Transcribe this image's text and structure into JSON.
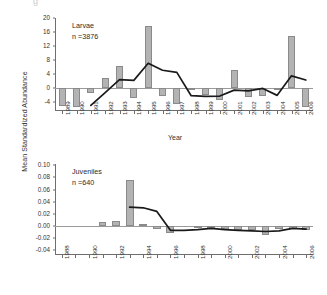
{
  "figure": {
    "shared_ylabel": "Mean Standardized Abundance",
    "stray_mark": "g"
  },
  "panels": [
    {
      "id": "larvae",
      "annotation_title": "Larvae",
      "annotation_n": "n =3876",
      "xlabel": "Year"
    },
    {
      "id": "juveniles",
      "annotation_title": "Juveniles",
      "annotation_n": "n =640",
      "xlabel": ""
    }
  ],
  "chart_data": [
    {
      "type": "bar",
      "id": "larvae",
      "title": "Larvae",
      "annotation": "n =3876",
      "xlabel": "Year",
      "ylabel": "Mean Standardized Abundance",
      "categories": [
        1989,
        1990,
        1991,
        1992,
        1993,
        1994,
        1995,
        1996,
        1997,
        1998,
        1999,
        2000,
        2001,
        2002,
        2003,
        2004,
        2005,
        2006
      ],
      "tick_labels": [
        "1989",
        "1990",
        "1991",
        "1992",
        "1993",
        "1994",
        "1995",
        "1996",
        "1997",
        "1998",
        "1999",
        "2000",
        "2001",
        "2002",
        "2003",
        "2004",
        "2005",
        "2006"
      ],
      "values": [
        -5.2,
        -5.4,
        -1.6,
        2.8,
        6.2,
        -3.0,
        17.6,
        -2.4,
        -4.6,
        -0.2,
        -2.2,
        -3.4,
        5.0,
        -2.6,
        -2.4,
        -0.3,
        14.8,
        -5.6
      ],
      "series": [
        {
          "name": "5-year moving average",
          "type": "line",
          "x": [
            1991,
            1992,
            1993,
            1994,
            1995,
            1996,
            1997,
            1998,
            1999,
            2000,
            2001,
            2002,
            2003,
            2004,
            2005,
            2006
          ],
          "values": [
            -5.1,
            -1.4,
            2.3,
            2.1,
            7.0,
            5.0,
            4.4,
            -2.3,
            -2.5,
            -2.4,
            -0.7,
            -0.9,
            -0.2,
            -2.2,
            3.4,
            2.2
          ]
        }
      ],
      "ylim": [
        -6.4,
        20
      ],
      "yticks": [
        -4,
        0,
        4,
        8,
        12,
        16,
        20
      ],
      "ytick_labels": [
        "-4",
        "0",
        "4",
        "8",
        "12",
        "16",
        "20"
      ],
      "grid": false,
      "legend": "none"
    },
    {
      "type": "bar",
      "id": "juveniles",
      "title": "Juveniles",
      "annotation": "n =640",
      "xlabel": "",
      "ylabel": "Mean Standardized Abundance",
      "categories": [
        1988,
        1989,
        1990,
        1991,
        1992,
        1993,
        1994,
        1995,
        1996,
        1997,
        1998,
        1999,
        2000,
        2001,
        2002,
        2003,
        2004,
        2005,
        2006
      ],
      "tick_labels": [
        "1988",
        "",
        "1990",
        "",
        "1992",
        "",
        "1994",
        "",
        "1996",
        "",
        "1998",
        "",
        "2000",
        "",
        "2002",
        "",
        "2004",
        "",
        "2006"
      ],
      "values": [
        0,
        0,
        0,
        0.007,
        0.009,
        0.075,
        0.003,
        -0.005,
        -0.011,
        0.0,
        -0.002,
        -0.004,
        -0.005,
        -0.006,
        -0.006,
        -0.015,
        -0.005,
        -0.005,
        -0.006
      ],
      "series": [
        {
          "name": "5-year moving average",
          "type": "line",
          "x": [
            1993,
            1994,
            1995,
            1996,
            1997,
            1998,
            1999,
            2000,
            2001,
            2002,
            2003,
            2004,
            2005,
            2006
          ],
          "values": [
            0.031,
            0.03,
            0.024,
            -0.007,
            -0.007,
            -0.006,
            -0.004,
            -0.006,
            -0.007,
            -0.008,
            -0.009,
            -0.008,
            -0.004,
            -0.005
          ]
        }
      ],
      "ylim": [
        -0.046,
        0.102
      ],
      "yticks": [
        -0.04,
        -0.02,
        0.0,
        0.02,
        0.04,
        0.06,
        0.08,
        0.1
      ],
      "ytick_labels": [
        "-0.04",
        "-0.02",
        "0.00",
        "0.02",
        "0.04",
        "0.06",
        "0.08",
        "0.10"
      ],
      "grid": false,
      "legend": "none"
    }
  ]
}
